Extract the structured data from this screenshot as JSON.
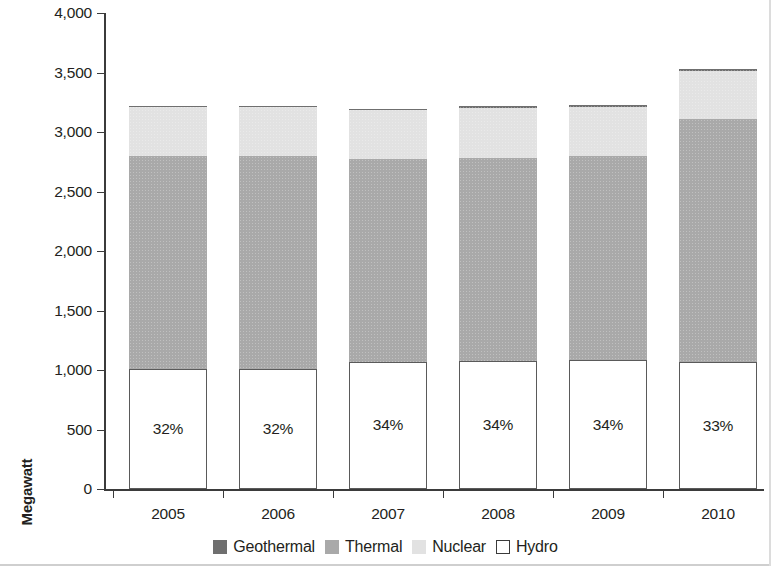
{
  "chart_data": {
    "type": "bar",
    "subtype": "stacked-bar",
    "title": "",
    "xlabel": "",
    "ylabel": "Megawatt",
    "ylim": [
      0,
      4000
    ],
    "ytick_values": [
      0,
      500,
      1000,
      1500,
      2000,
      2500,
      3000,
      3500,
      4000
    ],
    "ytick_labels": [
      "0",
      "500",
      "1,000",
      "1,500",
      "2,000",
      "2,500",
      "3,000",
      "3,500",
      "4,000"
    ],
    "categories": [
      "2005",
      "2006",
      "2007",
      "2008",
      "2009",
      "2010"
    ],
    "grid": false,
    "legend_position": "bottom",
    "stack_order_bottom_to_top": [
      "Hydro",
      "Thermal",
      "Nuclear",
      "Geothermal"
    ],
    "series": [
      {
        "name": "Hydro",
        "color": "#ffffff",
        "values": [
          1010,
          1010,
          1070,
          1075,
          1080,
          1065
        ]
      },
      {
        "name": "Thermal",
        "color": "#a9a9a9",
        "values": [
          1790,
          1790,
          1700,
          1705,
          1720,
          2045
        ]
      },
      {
        "name": "Nuclear",
        "color": "#e2e2e2",
        "values": [
          415,
          415,
          420,
          420,
          410,
          400
        ]
      },
      {
        "name": "Geothermal",
        "color": "#6f6f6f",
        "values": [
          5,
          5,
          5,
          20,
          20,
          20
        ]
      }
    ],
    "totals": [
      3220,
      3220,
      3195,
      3220,
      3230,
      3530
    ],
    "bar_labels": {
      "series": "Hydro",
      "values": [
        "32%",
        "32%",
        "34%",
        "34%",
        "34%",
        "33%"
      ]
    }
  },
  "legend": {
    "items": [
      {
        "label": "Geothermal",
        "swatch": "geothermal"
      },
      {
        "label": "Thermal",
        "swatch": "thermal"
      },
      {
        "label": "Nuclear",
        "swatch": "nuclear"
      },
      {
        "label": "Hydro",
        "swatch": "hydro"
      }
    ]
  },
  "colors": {
    "geothermal": "#6f6f6f",
    "thermal": "#a9a9a9",
    "nuclear": "#e2e2e2",
    "hydro": "#ffffff",
    "axis": "#3b3b3b",
    "text": "#231f20"
  }
}
